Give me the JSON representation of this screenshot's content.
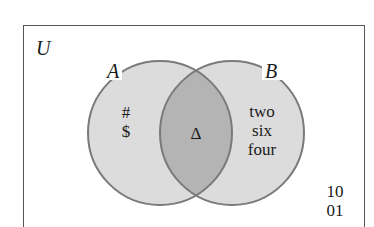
{
  "diagram": {
    "type": "venn",
    "universe_label": "U",
    "sets": [
      {
        "name": "A",
        "label": "A",
        "only_elements": [
          "#",
          "$"
        ]
      },
      {
        "name": "B",
        "label": "B",
        "only_elements": [
          "two",
          "six",
          "four"
        ]
      }
    ],
    "intersection": {
      "sets": [
        "A",
        "B"
      ],
      "elements": [
        "Δ"
      ]
    },
    "outside_elements": [
      "10",
      "01"
    ],
    "colors": {
      "circle_fill": "#dcdcdc",
      "intersection_fill": "#b4b4b4",
      "circle_stroke": "#7a7a7a",
      "border": "#555555",
      "text": "#1a1a1a"
    }
  },
  "labels": {
    "universe": "U",
    "set_a": "A",
    "set_b": "B",
    "a_only_1": "#",
    "a_only_2": "$",
    "intersection_1": "Δ",
    "b_only_1": "two",
    "b_only_2": "six",
    "b_only_3": "four",
    "outside_1": "10",
    "outside_2": "01"
  }
}
